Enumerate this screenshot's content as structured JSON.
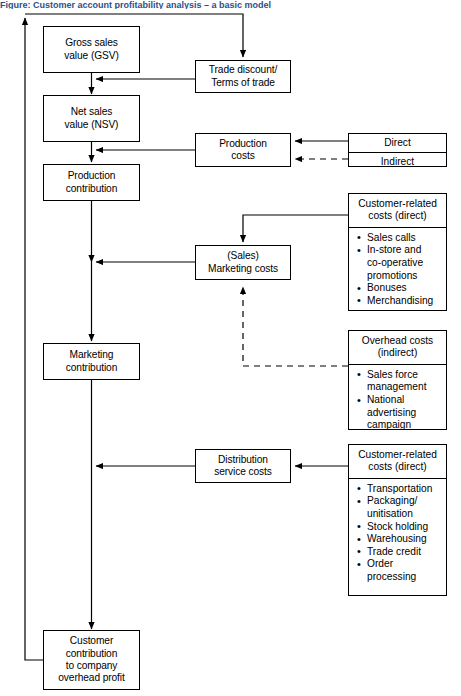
{
  "figure": {
    "title": "Figure: Customer account profitability analysis – a basic model",
    "type": "flow-diagram"
  },
  "nodes": {
    "gross_sales": {
      "lines": [
        "Gross sales",
        "value (GSV)"
      ]
    },
    "net_sales": {
      "lines": [
        "Net sales",
        "value (NSV)"
      ]
    },
    "production_contribution": {
      "lines": [
        "Production",
        "contribution"
      ]
    },
    "marketing_contribution": {
      "lines": [
        "Marketing",
        "contribution"
      ]
    },
    "customer_contribution": {
      "lines": [
        "Customer",
        "contribution",
        "to company",
        "overhead profit"
      ]
    },
    "trade_discount": {
      "lines": [
        "Trade discount/",
        "Terms of trade"
      ]
    },
    "production_costs": {
      "lines": [
        "Production",
        "costs"
      ]
    },
    "marketing_costs": {
      "lines": [
        "(Sales)",
        "Marketing costs"
      ]
    },
    "distribution_costs": {
      "lines": [
        "Distribution",
        "service costs"
      ]
    }
  },
  "cost_split": {
    "direct_label": "Direct",
    "indirect_label": "Indirect"
  },
  "panels": {
    "customer_related_marketing": {
      "head": [
        "Customer-related",
        "costs (direct)"
      ],
      "items": [
        "Sales calls",
        "In-store and\nco-operative\npromotions",
        "Bonuses",
        "Merchandising"
      ]
    },
    "overhead_indirect": {
      "head": [
        "Overhead costs",
        "(indirect)"
      ],
      "items": [
        "Sales force\nmanagement",
        "National\nadvertising\ncampaign"
      ]
    },
    "customer_related_distribution": {
      "head": [
        "Customer-related",
        "costs (direct)"
      ],
      "items": [
        "Transportation",
        "Packaging/\nunitisation",
        "Stock holding",
        "Warehousing",
        "Trade credit",
        "Order\nprocessing"
      ]
    }
  },
  "colors": {
    "stroke": "#000000",
    "background": "#ffffff",
    "title": "#2d4f8a"
  }
}
